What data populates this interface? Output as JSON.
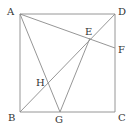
{
  "figure": {
    "type": "geometry",
    "line_color": "#8a8a8a",
    "label_color": "#333333"
  },
  "points": {
    "A": {
      "label": "A",
      "x": 20,
      "y": 14
    },
    "B": {
      "label": "B",
      "x": 20,
      "y": 112
    },
    "C": {
      "label": "C",
      "x": 115,
      "y": 112
    },
    "D": {
      "label": "D",
      "x": 115,
      "y": 14
    },
    "E": {
      "label": "E",
      "x": 90,
      "y": 38
    },
    "F": {
      "label": "F",
      "x": 115,
      "y": 48
    },
    "G": {
      "label": "G",
      "x": 60,
      "y": 112
    },
    "H": {
      "label": "H",
      "x": 47,
      "y": 83
    }
  },
  "segments": [
    [
      "A",
      "B"
    ],
    [
      "B",
      "C"
    ],
    [
      "C",
      "D"
    ],
    [
      "D",
      "A"
    ],
    [
      "B",
      "D"
    ],
    [
      "A",
      "F"
    ],
    [
      "A",
      "G"
    ],
    [
      "E",
      "G"
    ]
  ]
}
